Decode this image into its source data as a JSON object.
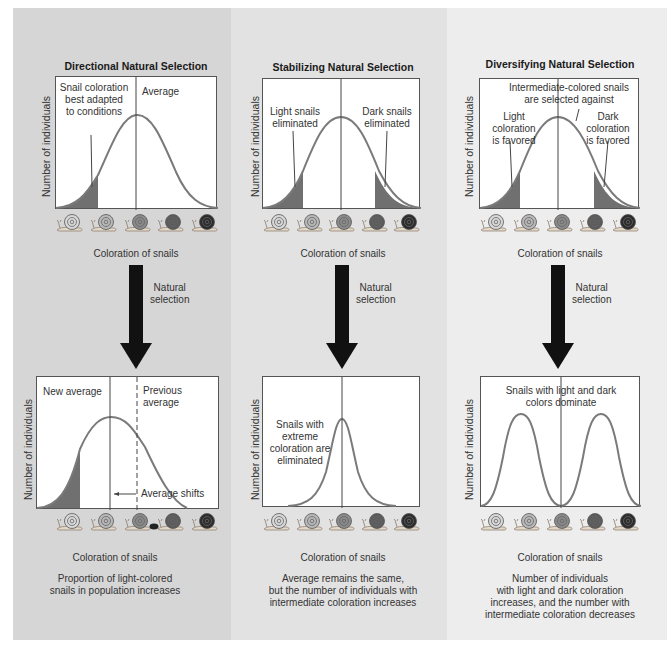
{
  "colors": {
    "curve": "#7a7a7a",
    "shade": "#707070",
    "panel_left": "#d6d6d6",
    "panel_middle": "#e2e2e2",
    "panel_right": "#ededed",
    "arrow": "#111111",
    "snail_shells": [
      "#d8d8d8",
      "#b8b8b8",
      "#8a8a8a",
      "#5c5c5c",
      "#2c2c2c"
    ]
  },
  "panels": [
    {
      "title": "Directional Natural Selection",
      "top_chart": {
        "ylabel": "Number of individuals",
        "annotations": [
          "Snail coloration",
          "best adapted",
          "to conditions"
        ],
        "average_label": "Average"
      },
      "xlabel_top": "Coloration of snails",
      "arrow_label": [
        "Natural",
        "selection"
      ],
      "bottom_chart": {
        "ylabel": "Number of individuals",
        "new_average": "New average",
        "previous_average": [
          "Previous",
          "average"
        ],
        "shift_label": "Average shifts"
      },
      "xlabel_bottom": "Coloration of snails",
      "caption": [
        "Proportion of light-colored",
        "snails in population increases"
      ]
    },
    {
      "title": "Stabilizing Natural Selection",
      "top_chart": {
        "ylabel": "Number of individuals",
        "left_annotation": [
          "Light snails",
          "eliminated"
        ],
        "right_annotation": [
          "Dark snails",
          "eliminated"
        ]
      },
      "xlabel_top": "Coloration of snails",
      "arrow_label": [
        "Natural",
        "selection"
      ],
      "bottom_chart": {
        "ylabel": "Number of individuals",
        "annotation": [
          "Snails with",
          "extreme",
          "coloration are",
          "eliminated"
        ]
      },
      "xlabel_bottom": "Coloration of snails",
      "caption": [
        "Average remains the same,",
        "but the number of individuals with",
        "intermediate coloration increases"
      ]
    },
    {
      "title": "Diversifying Natural Selection",
      "top_chart": {
        "ylabel": "Number of individuals",
        "top_annotation": [
          "Intermediate-colored snails",
          "are selected against"
        ],
        "left_annotation": [
          "Light",
          "coloration",
          "is favored"
        ],
        "right_annotation": [
          "Dark",
          "coloration",
          "is favored"
        ]
      },
      "xlabel_top": "Coloration of snails",
      "arrow_label": [
        "Natural",
        "selection"
      ],
      "bottom_chart": {
        "ylabel": "Number of individuals",
        "annotation": [
          "Snails with light and dark",
          "colors dominate"
        ]
      },
      "xlabel_bottom": "Coloration of snails",
      "caption": [
        "Number of individuals",
        "with light and dark coloration",
        "increases, and the number with",
        "intermediate coloration decreases"
      ]
    }
  ],
  "icons": {
    "snail": "snail-icon",
    "arrow": "down-arrow-icon",
    "bird": "bird-icon"
  }
}
